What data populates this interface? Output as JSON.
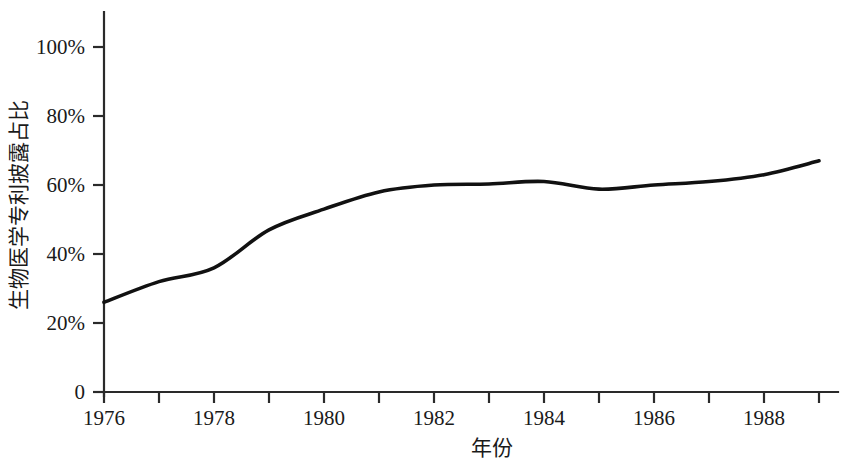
{
  "chart_data": {
    "type": "line",
    "title": "",
    "xlabel": "年份",
    "ylabel": "生物医学专利披露占比",
    "xlim": [
      1976,
      1989
    ],
    "ylim": [
      0,
      100
    ],
    "grid": false,
    "legend": "none",
    "x": [
      1976,
      1977,
      1978,
      1979,
      1980,
      1981,
      1982,
      1983,
      1984,
      1985,
      1986,
      1987,
      1988,
      1989
    ],
    "xtick_values": [
      1976,
      1977,
      1978,
      1979,
      1980,
      1981,
      1982,
      1983,
      1984,
      1985,
      1986,
      1987,
      1988,
      1989
    ],
    "xtick_labels": [
      "1976",
      "",
      "1978",
      "",
      "1980",
      "",
      "1982",
      "",
      "1984",
      "",
      "1986",
      "",
      "1988",
      ""
    ],
    "ytick_values": [
      0,
      20,
      40,
      60,
      80,
      100
    ],
    "ytick_labels": [
      "0",
      "20%",
      "40%",
      "60%",
      "80%",
      "100%"
    ],
    "series": [
      {
        "name": "生物医学专利披露占比",
        "color": "#111111",
        "values": [
          26,
          32,
          36,
          47,
          53,
          58,
          60,
          60.3,
          61,
          58.8,
          60,
          61,
          63,
          67
        ]
      }
    ]
  },
  "axes": {
    "y_title": "生物医学专利披露占比",
    "x_title": "年份",
    "y_labels": [
      "100%",
      "80%",
      "60%",
      "40%",
      "20%",
      "0"
    ],
    "x_labels": [
      "1976",
      "1978",
      "1980",
      "1982",
      "1984",
      "1986",
      "1988"
    ]
  }
}
